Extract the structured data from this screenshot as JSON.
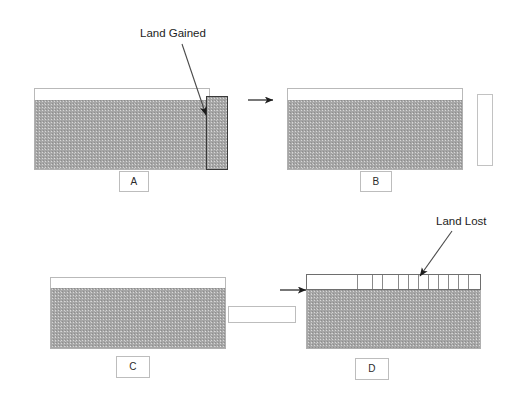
{
  "figure": {
    "background_color": "#ffffff",
    "soil_color": "#a6a6a6",
    "outline_color": "#b0b0b0",
    "callout_color": "#1d1d1d"
  },
  "annotations": {
    "land_gained": "Land Gained",
    "land_lost": "Land Lost"
  },
  "panels": [
    {
      "id": "A",
      "label": "A",
      "caption_box_label": "A",
      "has_top_void": true,
      "has_right_sliver": true,
      "sliver_style": "filled",
      "segmented_top": false
    },
    {
      "id": "B",
      "label": "B",
      "caption_box_label": "B",
      "has_top_void": true,
      "has_right_sliver": true,
      "sliver_style": "empty",
      "segmented_top": false
    },
    {
      "id": "C",
      "label": "C",
      "caption_box_label": "C",
      "has_top_void": true,
      "has_right_sliver": true,
      "sliver_style": "slab",
      "segmented_top": false
    },
    {
      "id": "D",
      "label": "D",
      "caption_box_label": "D",
      "has_top_void": false,
      "has_right_sliver": false,
      "sliver_style": "none",
      "segmented_top": true,
      "segment_count": 12
    }
  ],
  "arrows": {
    "a_to_b": "→",
    "c_to_d": "→"
  }
}
